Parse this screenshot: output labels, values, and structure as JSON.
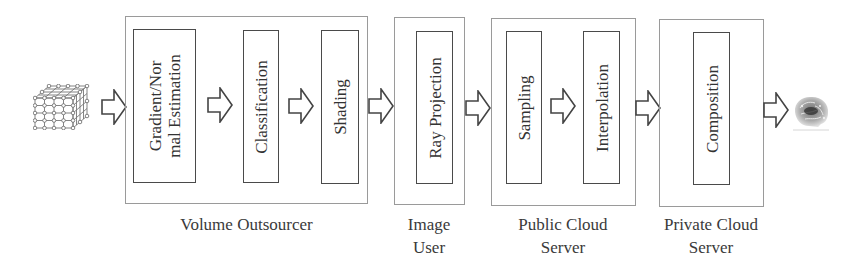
{
  "diagram": {
    "input_icon": "voxel-lattice-cube-icon",
    "output_icon": "rendered-brain-image-icon",
    "colors": {
      "outer_border": "#9a9a9a",
      "inner_border": "#4a4a4a",
      "text": "#333333",
      "background": "#ffffff"
    },
    "groups": [
      {
        "id": "volume-outsourcer",
        "label_lines": [
          "Volume Outsourcer"
        ],
        "steps": [
          {
            "lines": [
              "Gradient/Nor",
              "mal Estimation"
            ]
          },
          {
            "lines": [
              "Classification"
            ]
          },
          {
            "lines": [
              "Shading"
            ]
          }
        ]
      },
      {
        "id": "image-user",
        "label_lines": [
          "Image",
          "User"
        ],
        "steps": [
          {
            "lines": [
              "Ray Projection"
            ]
          }
        ]
      },
      {
        "id": "public-cloud-server",
        "label_lines": [
          "Public Cloud",
          "Server"
        ],
        "steps": [
          {
            "lines": [
              "Sampling"
            ]
          },
          {
            "lines": [
              "Interpolation"
            ]
          }
        ]
      },
      {
        "id": "private-cloud-server",
        "label_lines": [
          "Private Cloud",
          "Server"
        ],
        "steps": [
          {
            "lines": [
              "Composition"
            ]
          }
        ]
      }
    ],
    "flow": [
      "Input volume",
      "Gradient/Normal Estimation",
      "Classification",
      "Shading",
      "Ray Projection",
      "Sampling",
      "Interpolation",
      "Composition",
      "Output image"
    ]
  }
}
